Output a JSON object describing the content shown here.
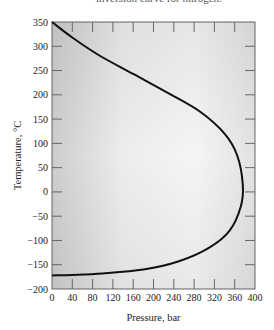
{
  "figure": {
    "caption_partial": "inversion curve for nitrogen."
  },
  "chart_data": {
    "type": "line",
    "title": "",
    "xlabel": "Pressure, bar",
    "ylabel": "Temperature, °C",
    "xlim": [
      0,
      400
    ],
    "ylim": [
      -200,
      350
    ],
    "x_ticks": [
      0,
      40,
      80,
      120,
      160,
      200,
      240,
      280,
      320,
      360,
      400
    ],
    "y_ticks": [
      350,
      300,
      250,
      200,
      150,
      100,
      50,
      0,
      -50,
      -100,
      -150,
      -200
    ],
    "grid": false,
    "legend": null,
    "background": "gradient-shaded",
    "series": [
      {
        "name": "Inversion curve",
        "color": "#111111",
        "points": [
          {
            "x": 0,
            "y": 350
          },
          {
            "x": 40,
            "y": 318
          },
          {
            "x": 95,
            "y": 280
          },
          {
            "x": 160,
            "y": 243
          },
          {
            "x": 230,
            "y": 203
          },
          {
            "x": 292,
            "y": 165
          },
          {
            "x": 340,
            "y": 120
          },
          {
            "x": 365,
            "y": 75
          },
          {
            "x": 376,
            "y": 15
          },
          {
            "x": 372,
            "y": -30
          },
          {
            "x": 350,
            "y": -80
          },
          {
            "x": 310,
            "y": -115
          },
          {
            "x": 250,
            "y": -143
          },
          {
            "x": 180,
            "y": -160
          },
          {
            "x": 100,
            "y": -168
          },
          {
            "x": 40,
            "y": -171
          },
          {
            "x": 0,
            "y": -172
          }
        ]
      }
    ]
  }
}
